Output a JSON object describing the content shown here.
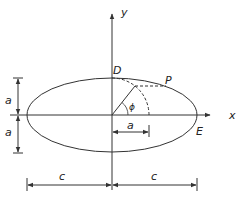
{
  "diagram": {
    "type": "ellipse-geometry",
    "colors": {
      "stroke": "#333333",
      "background": "#ffffff"
    },
    "axes": {
      "x_label": "x",
      "y_label": "y"
    },
    "points": {
      "D": "D",
      "P": "P",
      "E": "E"
    },
    "angle_label": "ϕ",
    "dimensions": {
      "semi_minor_top": "a",
      "semi_minor_bottom": "a",
      "radius": "a",
      "semi_major_left": "c",
      "semi_major_right": "c"
    }
  }
}
